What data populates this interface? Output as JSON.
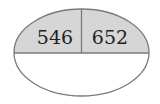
{
  "diagram": {
    "type": "ellipse-partition",
    "colors": {
      "top_fill": "#d6d6d6",
      "bottom_fill": "#ffffff",
      "stroke": "#7a7a7a",
      "text": "#222222"
    },
    "cells": {
      "top_left": {
        "value": "546"
      },
      "top_right": {
        "value": "652"
      },
      "bottom": {
        "value": ""
      }
    }
  }
}
